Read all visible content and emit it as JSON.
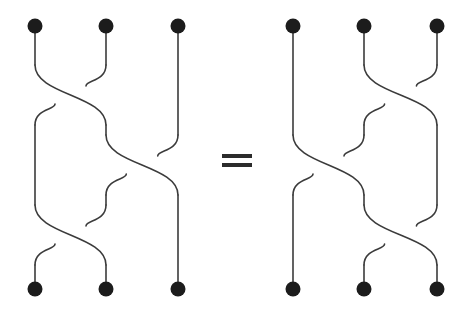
{
  "figure": {
    "kind": "braid-relation-diagram",
    "caption_text": "",
    "relation_symbol": "=",
    "background_color": "#ffffff",
    "strand_color": "#3b3b3b",
    "node_color": "#1c1c1c",
    "strand_width": 1.6,
    "node_radius": 7.5,
    "canvas": {
      "width": 473,
      "height": 309
    }
  },
  "equals": {
    "symbol": "=",
    "x": 222,
    "y": 154,
    "bar_width": 30,
    "bar_height": 4,
    "bar_gap": 9
  },
  "chart_data": {
    "type": "diagram",
    "title": "",
    "braids": [
      {
        "name": "left-braid",
        "word": "s1 s2 s1",
        "lane_x": [
          35,
          106,
          178
        ],
        "top_y": 26,
        "bottom_y": 289,
        "crossings": [
          {
            "index": 1,
            "lanes": [
              1,
              2
            ],
            "center_y": 95,
            "over": "left-to-right"
          },
          {
            "index": 2,
            "lanes": [
              2,
              3
            ],
            "center_y": 165,
            "over": "left-to-right"
          },
          {
            "index": 3,
            "lanes": [
              1,
              2
            ],
            "center_y": 235,
            "over": "left-to-right"
          }
        ],
        "top_nodes": [
          {
            "label": "top-node-1",
            "x": 35,
            "y": 26
          },
          {
            "label": "top-node-2",
            "x": 106,
            "y": 26
          },
          {
            "label": "top-node-3",
            "x": 178,
            "y": 26
          }
        ],
        "bottom_nodes": [
          {
            "label": "bottom-node-1",
            "x": 35,
            "y": 289
          },
          {
            "label": "bottom-node-2",
            "x": 106,
            "y": 289
          },
          {
            "label": "bottom-node-3",
            "x": 178,
            "y": 289
          }
        ]
      },
      {
        "name": "right-braid",
        "word": "s2 s1 s2",
        "lane_x": [
          293,
          364,
          437
        ],
        "top_y": 26,
        "bottom_y": 289,
        "crossings": [
          {
            "index": 1,
            "lanes": [
              2,
              3
            ],
            "center_y": 95,
            "over": "left-to-right"
          },
          {
            "index": 2,
            "lanes": [
              1,
              2
            ],
            "center_y": 165,
            "over": "left-to-right"
          },
          {
            "index": 3,
            "lanes": [
              2,
              3
            ],
            "center_y": 235,
            "over": "left-to-right"
          }
        ],
        "top_nodes": [
          {
            "label": "top-node-1",
            "x": 293,
            "y": 26
          },
          {
            "label": "top-node-2",
            "x": 364,
            "y": 26
          },
          {
            "label": "top-node-3",
            "x": 437,
            "y": 26
          }
        ],
        "bottom_nodes": [
          {
            "label": "bottom-node-1",
            "x": 293,
            "y": 289
          },
          {
            "label": "bottom-node-2",
            "x": 364,
            "y": 289
          },
          {
            "label": "bottom-node-3",
            "x": 437,
            "y": 289
          }
        ]
      }
    ]
  }
}
